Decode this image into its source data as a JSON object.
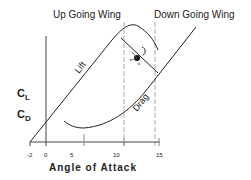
{
  "diagram": {
    "header_left": "Up Going Wing",
    "header_right": "Down Going Wing",
    "curve_lift_label": "Lift",
    "curve_drag_label": "Drag",
    "y_label_cl": "C",
    "y_label_cl_sub": "L",
    "y_label_cd": "C",
    "y_label_cd_sub": "D",
    "x_axis_title": "Angle of Attack",
    "x_ticks": [
      "-2",
      "0",
      "5",
      "10",
      "15"
    ]
  },
  "colors": {
    "line": "#222222",
    "dashed": "#aaaaaa",
    "background": "#ffffff"
  }
}
